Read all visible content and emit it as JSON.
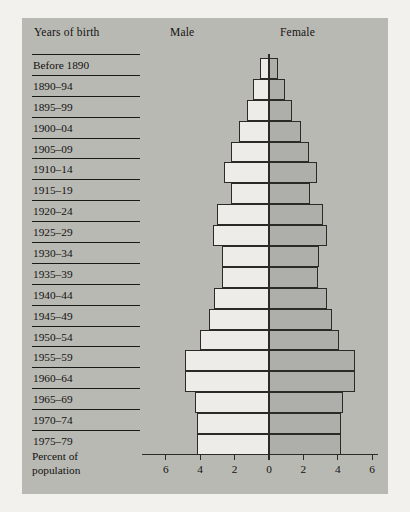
{
  "header": {
    "years_label": "Years of birth",
    "male_label": "Male",
    "female_label": "Female"
  },
  "caption": {
    "line1": "Percent of",
    "line2": "population"
  },
  "colors": {
    "background": "#b9b9b4",
    "page": "#f2f1ee",
    "male_bar": "#edece9",
    "female_bar": "#aeaeaa",
    "ink": "#2b2a27"
  },
  "chart_data": {
    "type": "bar",
    "title": "",
    "subtitle": "",
    "xlabel": "Percent of population",
    "ylabel": "Years of birth",
    "orientation": "population-pyramid",
    "xlim": [
      -6,
      6
    ],
    "grid": false,
    "legend_position": "top",
    "axis_ticks": [
      "6",
      "4",
      "2",
      "0",
      "2",
      "4",
      "6"
    ],
    "axis_tick_values": [
      -6,
      -4,
      -2,
      0,
      2,
      4,
      6
    ],
    "categories": [
      "Before 1890",
      "1890–94",
      "1895–99",
      "1900–04",
      "1905–09",
      "1910–14",
      "1915–19",
      "1920–24",
      "1925–29",
      "1930–34",
      "1935–39",
      "1940–44",
      "1945–49",
      "1950–54",
      "1955–59",
      "1960–64",
      "1965–69",
      "1970–74",
      "1975–79"
    ],
    "series": [
      {
        "name": "Male",
        "side": "left",
        "values": [
          0.55,
          0.95,
          1.3,
          1.75,
          2.2,
          2.6,
          2.2,
          3.0,
          3.25,
          2.75,
          2.75,
          3.2,
          3.5,
          4.0,
          4.9,
          4.9,
          4.3,
          4.2,
          4.2
        ]
      },
      {
        "name": "Female",
        "side": "right",
        "values": [
          0.55,
          0.95,
          1.35,
          1.85,
          2.3,
          2.8,
          2.4,
          3.15,
          3.4,
          2.9,
          2.85,
          3.35,
          3.65,
          4.05,
          5.0,
          5.0,
          4.3,
          4.2,
          4.2
        ]
      }
    ]
  }
}
